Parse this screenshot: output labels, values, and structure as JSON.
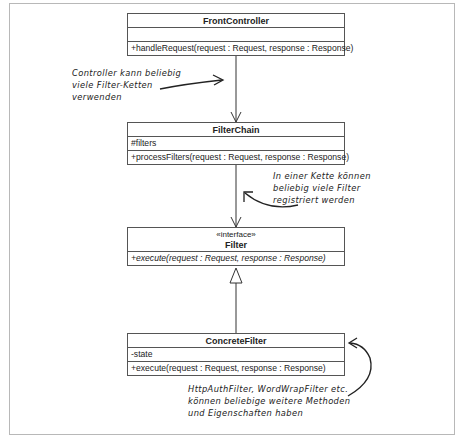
{
  "classes": {
    "front_controller": {
      "name": "FrontController",
      "attributes": [],
      "operations": [
        "+handleRequest(request : Request, response : Response)"
      ]
    },
    "filter_chain": {
      "name": "FilterChain",
      "attributes": [
        "#filters"
      ],
      "operations": [
        "+processFilters(request : Request, response : Response)"
      ]
    },
    "filter": {
      "stereotype": "«interface»",
      "name": "Filter",
      "operations": [
        "+execute(request : Request, response : Response)"
      ]
    },
    "concrete_filter": {
      "name": "ConcreteFilter",
      "attributes": [
        "-state"
      ],
      "operations": [
        "+execute(request : Request, response : Response)"
      ]
    }
  },
  "relations": [
    {
      "from": "FrontController",
      "to": "FilterChain",
      "type": "association"
    },
    {
      "from": "FilterChain",
      "to": "Filter",
      "type": "association"
    },
    {
      "from": "ConcreteFilter",
      "to": "Filter",
      "type": "realization"
    }
  ],
  "notes": {
    "controller_note": [
      "Controller kann beliebig",
      "viele Filter-Ketten",
      "verwenden"
    ],
    "chain_note": [
      "In einer Kette können",
      "beliebig viele Filter",
      "registriert werden"
    ],
    "concrete_note": [
      "HttpAuthFilter, WordWrapFilter etc.",
      "können beliebige weitere Methoden",
      "und Eigenschaften haben"
    ]
  }
}
